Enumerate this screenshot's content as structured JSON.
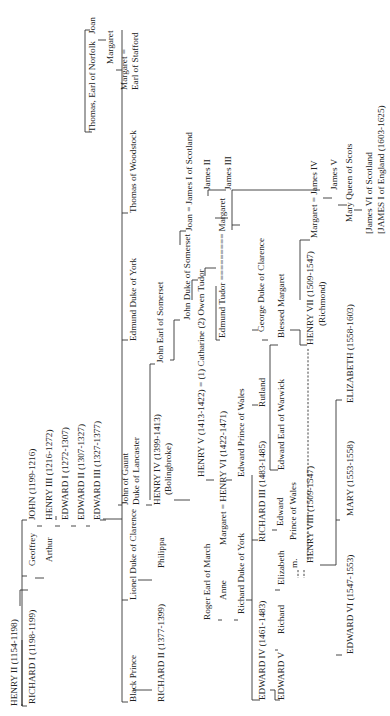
{
  "orientation": "rotated 90 degrees counter-clockwise",
  "nodes": [
    {
      "id": "henry2",
      "label": "HENRY II (1154-1198)",
      "x": 17,
      "y": 706
    },
    {
      "id": "richard1",
      "label": "RICHARD I (1198-1199)",
      "x": 35,
      "y": 704
    },
    {
      "id": "geoffrey",
      "label": "Geoffrey",
      "x": 35,
      "y": 566
    },
    {
      "id": "arthur",
      "label": "Arthur",
      "x": 52,
      "y": 562
    },
    {
      "id": "john",
      "label": "JOHN (1199-1216)",
      "x": 35,
      "y": 520
    },
    {
      "id": "henry3",
      "label": "HENRY III (1216-1272)",
      "x": 52,
      "y": 520
    },
    {
      "id": "edward1",
      "label": "EDWARD I (1272-1307)",
      "x": 68,
      "y": 520
    },
    {
      "id": "edward2",
      "label": "EDWARD II (1307-1327)",
      "x": 84,
      "y": 520
    },
    {
      "id": "edward3",
      "label": "EDWARD III (1327-1377)",
      "x": 100,
      "y": 520
    },
    {
      "id": "black_prince",
      "label": "Black Prince",
      "x": 136,
      "y": 702
    },
    {
      "id": "richard2",
      "label": "RICHARD II (1377-1399)",
      "x": 164,
      "y": 702
    },
    {
      "id": "lionel",
      "label": "Lionel Duke of Clarence",
      "x": 136,
      "y": 600
    },
    {
      "id": "philippa",
      "label": "Philippa",
      "x": 164,
      "y": 568
    },
    {
      "id": "roger",
      "label": "Roger Earl of March",
      "x": 210,
      "y": 620
    },
    {
      "id": "anne",
      "label": "Anne",
      "x": 226,
      "y": 600
    },
    {
      "id": "richard_york",
      "label": "Richard Duke of York",
      "x": 244,
      "y": 614
    },
    {
      "id": "john_gaunt1",
      "label": "John of Gaunt",
      "x": 128,
      "y": 505
    },
    {
      "id": "john_gaunt2",
      "label": "Duke of Lancaster",
      "x": 139,
      "y": 505
    },
    {
      "id": "henry4",
      "label": "HENRY IV (1399-1413)",
      "x": 160,
      "y": 505
    },
    {
      "id": "bolingbroke",
      "label": "(Bolingbroke)",
      "x": 171,
      "y": 495
    },
    {
      "id": "henry5",
      "label": "HENRY V (1413-1422)  =  (1) Catharine (2) Owen Tudor",
      "x": 204,
      "y": 477
    },
    {
      "id": "margaret_anjou",
      "label": "Margaret = HENRY VI (1422-1471)",
      "x": 226,
      "y": 545
    },
    {
      "id": "edward_pow",
      "label": "Edward Prince of Wales",
      "x": 244,
      "y": 477
    },
    {
      "id": "edmund_york",
      "label": "Edmund Duke of York",
      "x": 136,
      "y": 341
    },
    {
      "id": "john_somerset_earl",
      "label": "John Earl of Somerset",
      "x": 163,
      "y": 363
    },
    {
      "id": "john_somerset_duke",
      "label": "John Duke of Somerset",
      "x": 190,
      "y": 320
    },
    {
      "id": "edmund_tudor",
      "label": "Edmund Tudor ========= Margaret",
      "x": 225,
      "y": 338
    },
    {
      "id": "thomas_woodstock",
      "label": "Thomas of Woodstock",
      "x": 136,
      "y": 213
    },
    {
      "id": "joan_james1",
      "label": "Joan  =  James I of Scotland",
      "x": 192,
      "y": 231
    },
    {
      "id": "james2",
      "label": "James II",
      "x": 210,
      "y": 190
    },
    {
      "id": "james3",
      "label": "James III",
      "x": 231,
      "y": 190
    },
    {
      "id": "thomas_norfolk",
      "label": "Thomas, Earl of Norfolk",
      "x": 95,
      "y": 132
    },
    {
      "id": "joan",
      "label": "Joan",
      "x": 95,
      "y": 34
    },
    {
      "id": "margaret_n",
      "label": "Margaret",
      "x": 113,
      "y": 64
    },
    {
      "id": "margaret_stafford1",
      "label": "Margaret =",
      "x": 127,
      "y": 90
    },
    {
      "id": "margaret_stafford2",
      "label": "Earl of Stafford",
      "x": 138,
      "y": 90
    },
    {
      "id": "edward4",
      "label": "EDWARD IV (1461-1483)",
      "x": 265,
      "y": 700
    },
    {
      "id": "edward5",
      "label": "EDWARD V",
      "x": 284,
      "y": 700
    },
    {
      "id": "richard_pr",
      "label": "Richard",
      "x": 284,
      "y": 634
    },
    {
      "id": "elizabeth_y",
      "label": "Elizabeth",
      "x": 284,
      "y": 585
    },
    {
      "id": "m_mark",
      "label": "m.",
      "x": 297,
      "y": 568
    },
    {
      "id": "richard3",
      "label": "RICHARD III (1483-1485)",
      "x": 265,
      "y": 542
    },
    {
      "id": "edward_pw3a",
      "label": "Edward",
      "x": 283,
      "y": 526
    },
    {
      "id": "edward_pw3b",
      "label": "Prince of Wales",
      "x": 296,
      "y": 540
    },
    {
      "id": "rutland",
      "label": "Rutland",
      "x": 265,
      "y": 407
    },
    {
      "id": "edward_warwick",
      "label": "Edward Earl of Warwick",
      "x": 284,
      "y": 470
    },
    {
      "id": "george_clarence",
      "label": "George Duke of Clarence",
      "x": 264,
      "y": 332
    },
    {
      "id": "blessed_margaret",
      "label": "Blessed Margaret",
      "x": 284,
      "y": 338
    },
    {
      "id": "henry7",
      "label": "HENRY VII (1509-1547)",
      "x": 313,
      "y": 345
    },
    {
      "id": "richmond",
      "label": "(Richmond)",
      "x": 325,
      "y": 326
    },
    {
      "id": "henry8",
      "label": "HENRY VIII (1509-1547)",
      "x": 313,
      "y": 563
    },
    {
      "id": "edward6",
      "label": "EDWARD VI (1547-1553)",
      "x": 353,
      "y": 654
    },
    {
      "id": "mary1",
      "label": "MARY (1553-1558)",
      "x": 353,
      "y": 516
    },
    {
      "id": "elizabeth1",
      "label": "ELIZABETH (1558-1603)",
      "x": 353,
      "y": 403
    },
    {
      "id": "margaret_james4",
      "label": "Margaret  =  James IV",
      "x": 317,
      "y": 238
    },
    {
      "id": "james5",
      "label": "James V",
      "x": 337,
      "y": 190
    },
    {
      "id": "mary_scots",
      "label": "Mary Queen of Scots",
      "x": 352,
      "y": 222
    },
    {
      "id": "james6a",
      "label": "[James VI of Scotland",
      "x": 372,
      "y": 234
    },
    {
      "id": "james6b",
      "label": "[JAMES I of England  (1603-1625)",
      "x": 384,
      "y": 234
    }
  ],
  "lines": [
    "M20,606 L20,590 L28,590",
    "M22,704 L22,706 M22,640 L22,706 L27,706",
    "M22,520 L22,706",
    "M22,520 L27,520",
    "M22,576 L27,576",
    "M35,578 L44,578",
    "M37,526 L42,526 M55,526 L60,526 M71,526 L76,526 M86,526 L90,526",
    "M56,520 L56,516",
    "M100,520 L106,520",
    "M103,519 L122,519",
    "M122,30 L122,702 L128,702",
    "M122,600 L128,600 M122,505 L118,505 M122,340 L128,340 M122,213 L128,213",
    "M85,30 L85,132 L92,132 M85,30 L90,30",
    "M98,40 L106,40 M116,70 L122,70",
    "M133,690 L152,690",
    "M138,580 L152,580",
    "M146,505 L152,505 M150,500 L150,364 L155,364",
    "M174,500 L190,500",
    "M170,360 L174,360 L174,320 L180,320",
    "M180,245 L180,231 L186,231",
    "M192,300 L192,280 L198,280",
    "M205,276 L205,268 L216,268",
    "M228,218 L215,218 M232,225 L240,225",
    "M208,196 L208,190 L226,190",
    "M216,286 L216,340 L220,340",
    "M232,230 L232,190 L320,190",
    "M206,480 L214,480 M226,480 L232,480",
    "M218,620 L222,620 M234,620 L238,620",
    "M246,600 L252,600",
    "M252,475 L252,700 L260,700",
    "M252,540 L258,540 M252,405 L258,405 M252,330 L258,330",
    "M270,690 L275,690 L275,700 L280,700 M275,650 L278,650 M275,590 L280,590",
    "M272,530 L277,530",
    "M262,340 L268,340",
    "M270,345 L278,345 M270,345 L270,470 L278,470",
    "M290,330 L300,330 L300,345 L307,345",
    "M300,300 L300,240 L310,240",
    "M320,565 L336,565 L336,400 L342,400 M336,655 L342,655 M336,520 L340,520",
    "M323,198 L332,198 M338,205 L347,205 M354,210 L362,210"
  ],
  "dashed_lines": [
    "M308,560 L308,349",
    "M298,570 L298,578 M304,570 L304,578"
  ]
}
